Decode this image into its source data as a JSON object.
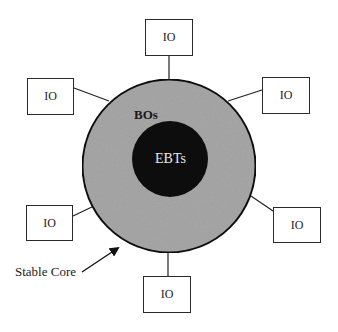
{
  "diagram": {
    "center_label": "EBTs",
    "ring_label": "BOs",
    "core_annotation": "Stable Core",
    "io_nodes": [
      {
        "id": "top",
        "label": "IO"
      },
      {
        "id": "upper-left",
        "label": "IO"
      },
      {
        "id": "upper-right",
        "label": "IO"
      },
      {
        "id": "lower-left",
        "label": "IO"
      },
      {
        "id": "lower-right",
        "label": "IO"
      },
      {
        "id": "bottom",
        "label": "IO"
      }
    ],
    "colors": {
      "outer_ring_fill": "#a8a8a8",
      "inner_core_fill": "#0d0d0d",
      "outline": "#111111",
      "box_border": "#2a2a2a"
    }
  }
}
